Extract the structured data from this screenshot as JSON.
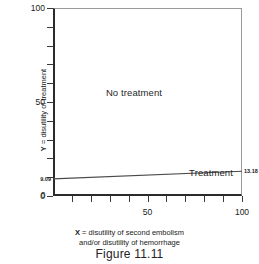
{
  "figure": {
    "caption": "Figure 11.11"
  },
  "chart_data": {
    "type": "line",
    "title": "",
    "subtitle": "",
    "xlabel_line1": "X = disutility of second embolism",
    "xlabel_line2": "and/or disutility of hemorrhage",
    "xlabel_prefix": "X",
    "xlabel_rest_line1": " = disutility of second embolism",
    "ylabel_prefix": "Y",
    "ylabel_rest": " = disutility of treatment",
    "ylabel_full": "Y = disutility of treatment",
    "xlim": [
      0,
      100
    ],
    "ylim": [
      0,
      100
    ],
    "grid": false,
    "legend": "none",
    "x_major_ticks": [
      0,
      50,
      100
    ],
    "y_major_ticks": [
      0,
      50,
      100
    ],
    "x_minor_ticks": [
      10,
      20,
      30,
      40,
      60,
      70,
      80,
      90
    ],
    "y_minor_ticks": [
      10,
      20,
      30,
      40,
      60,
      70,
      80,
      90
    ],
    "x_tick_labels": [
      "0",
      "50",
      "100"
    ],
    "y_tick_labels": [
      "0",
      "50",
      "100"
    ],
    "series": [
      {
        "name": "threshold line",
        "x": [
          0,
          100
        ],
        "y": [
          9.09,
          13.18
        ]
      }
    ],
    "point_annotations": [
      {
        "label": "9.09",
        "x": 0,
        "y": 9.09,
        "position": "left-outside"
      },
      {
        "label": "13.18",
        "x": 100,
        "y": 13.18,
        "position": "right-outside"
      }
    ],
    "region_annotations": [
      {
        "label": "No treatment",
        "x": 28,
        "y": 55
      },
      {
        "label": "Treatment",
        "x": 72,
        "y": 12
      }
    ]
  }
}
